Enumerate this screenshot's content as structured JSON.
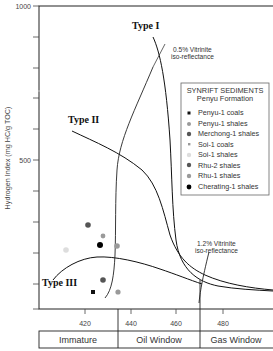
{
  "chart_data": {
    "type": "scatter",
    "title": "",
    "xlabel": "Tmax (°C)",
    "ylabel": "Hydrogen Index (mg HC/g TOC)",
    "xlim": [
      400,
      500
    ],
    "ylim": [
      0,
      1000
    ],
    "x_ticks": [
      420,
      440,
      460,
      480
    ],
    "y_ticks_labeled": [
      500,
      1000
    ],
    "y_tick_step": 100,
    "grid": false,
    "legend_position": "upper right",
    "legend": {
      "title": "SYNRIFT SEDIMENTS",
      "subtitle": "Penyu Formation",
      "entries": [
        {
          "name": "Penyu-1 coals",
          "marker": "square",
          "color": "#111111"
        },
        {
          "name": "Penyu-1 shales",
          "marker": "circle",
          "color": "#9a9a9a"
        },
        {
          "name": "Merchong-1 shales",
          "marker": "circle",
          "color": "#555555"
        },
        {
          "name": "Soi-1 coals",
          "marker": "square-small",
          "color": "#9a9a9a"
        },
        {
          "name": "Soi-1 shales",
          "marker": "circle",
          "color": "#dddddd"
        },
        {
          "name": "Rhu-2 shales",
          "marker": "circle",
          "color": "#555555"
        },
        {
          "name": "Rhu-1 shales",
          "marker": "circle",
          "color": "#9a9a9a"
        },
        {
          "name": "Cherating-1 shales",
          "marker": "circle",
          "color": "#000000"
        }
      ]
    },
    "series": [
      {
        "name": "Penyu-1 coals",
        "points": [
          [
            424,
            70
          ]
        ]
      },
      {
        "name": "Penyu-1 shales",
        "points": [
          [
            433,
            60
          ]
        ]
      },
      {
        "name": "Merchong-1 shales",
        "points": [
          [
            426,
            125
          ]
        ]
      },
      {
        "name": "Soi-1 coals",
        "points": [
          [
            427,
            227
          ]
        ]
      },
      {
        "name": "Soi-1 shales",
        "points": [
          [
            412,
            210
          ]
        ]
      },
      {
        "name": "Rhu-2 shales",
        "points": [
          [
            423,
            258
          ]
        ]
      },
      {
        "name": "Rhu-1 shales",
        "points": [
          [
            433,
            211
          ]
        ]
      },
      {
        "name": "Cherating-1 shales",
        "points": [
          [
            427,
            214
          ]
        ]
      }
    ],
    "curves": [
      {
        "name": "Type I",
        "points": [
          [
            460,
            900
          ],
          [
            463,
            800
          ],
          [
            465,
            650
          ],
          [
            466,
            450
          ],
          [
            467,
            320
          ],
          [
            469,
            230
          ],
          [
            472,
            170
          ],
          [
            480,
            120
          ],
          [
            500,
            100
          ]
        ]
      },
      {
        "name": "Type II",
        "points": [
          [
            425,
            580
          ],
          [
            440,
            500
          ],
          [
            450,
            430
          ],
          [
            458,
            360
          ],
          [
            462,
            280
          ],
          [
            466,
            220
          ],
          [
            471,
            190
          ],
          [
            480,
            150
          ],
          [
            495,
            120
          ]
        ]
      },
      {
        "name": "Type III",
        "points": [
          [
            412,
            120
          ],
          [
            420,
            170
          ],
          [
            430,
            205
          ],
          [
            440,
            203
          ],
          [
            450,
            190
          ],
          [
            460,
            170
          ],
          [
            470,
            150
          ]
        ]
      },
      {
        "name": "0.5% Vitrinite iso-reflectance",
        "points": [
          [
            430,
            20
          ],
          [
            433,
            90
          ],
          [
            434,
            200
          ],
          [
            434,
            340
          ],
          [
            437,
            480
          ],
          [
            448,
            600
          ],
          [
            465,
            810
          ]
        ]
      },
      {
        "name": "1.2% Vitrinite iso-reflectance",
        "points": [
          [
            470,
            90
          ],
          [
            471,
            140
          ],
          [
            474,
            230
          ]
        ]
      }
    ],
    "annotations": [
      {
        "text": "Type I",
        "x": 452,
        "y": 945
      },
      {
        "text": "Type II",
        "x": 412,
        "y": 600
      },
      {
        "text": "Type III",
        "x": 401,
        "y": 80
      },
      {
        "text": "0.5% Vitrinite iso-reflectance",
        "x": 468,
        "y": 870
      },
      {
        "text": "1.2% Vitrinite iso-reflectance",
        "x": 475,
        "y": 260
      }
    ],
    "maturity_zones": [
      {
        "label": "Immature",
        "from": 400,
        "to": 435
      },
      {
        "label": "Oil Window",
        "from": 435,
        "to": 470
      },
      {
        "label": "Gas Window",
        "from": 470,
        "to": 500
      }
    ]
  },
  "labels": {
    "y_axis": "Hydrogen Index (mg HC/g TOC)",
    "y_1000": "1000",
    "y_500": "500",
    "x_420": "420",
    "x_440": "440",
    "x_460": "460",
    "x_480": "480",
    "type1": "Type I",
    "type2": "Type II",
    "type3": "Type III",
    "vr05_line1": "0.5%  Vitrinite",
    "vr05_line2": "iso-reflectance",
    "vr12_line1": "1.2%  Vitrinite",
    "vr12_line2": "iso-reflectance",
    "legend_title": "SYNRIFT  SEDIMENTS",
    "legend_subtitle": "Penyu  Formation",
    "legend_items": [
      "Penyu-1 coals",
      "Penyu-1 shales",
      "Merchong-1 shales",
      "Soi-1 coals",
      "Soi-1 shales",
      "Rhu-2  shales",
      "Rhu-1 shales",
      "Cherating-1 shales"
    ],
    "zone_immature": "Immature",
    "zone_oil": "Oil Window",
    "zone_gas": "Gas  Window"
  }
}
